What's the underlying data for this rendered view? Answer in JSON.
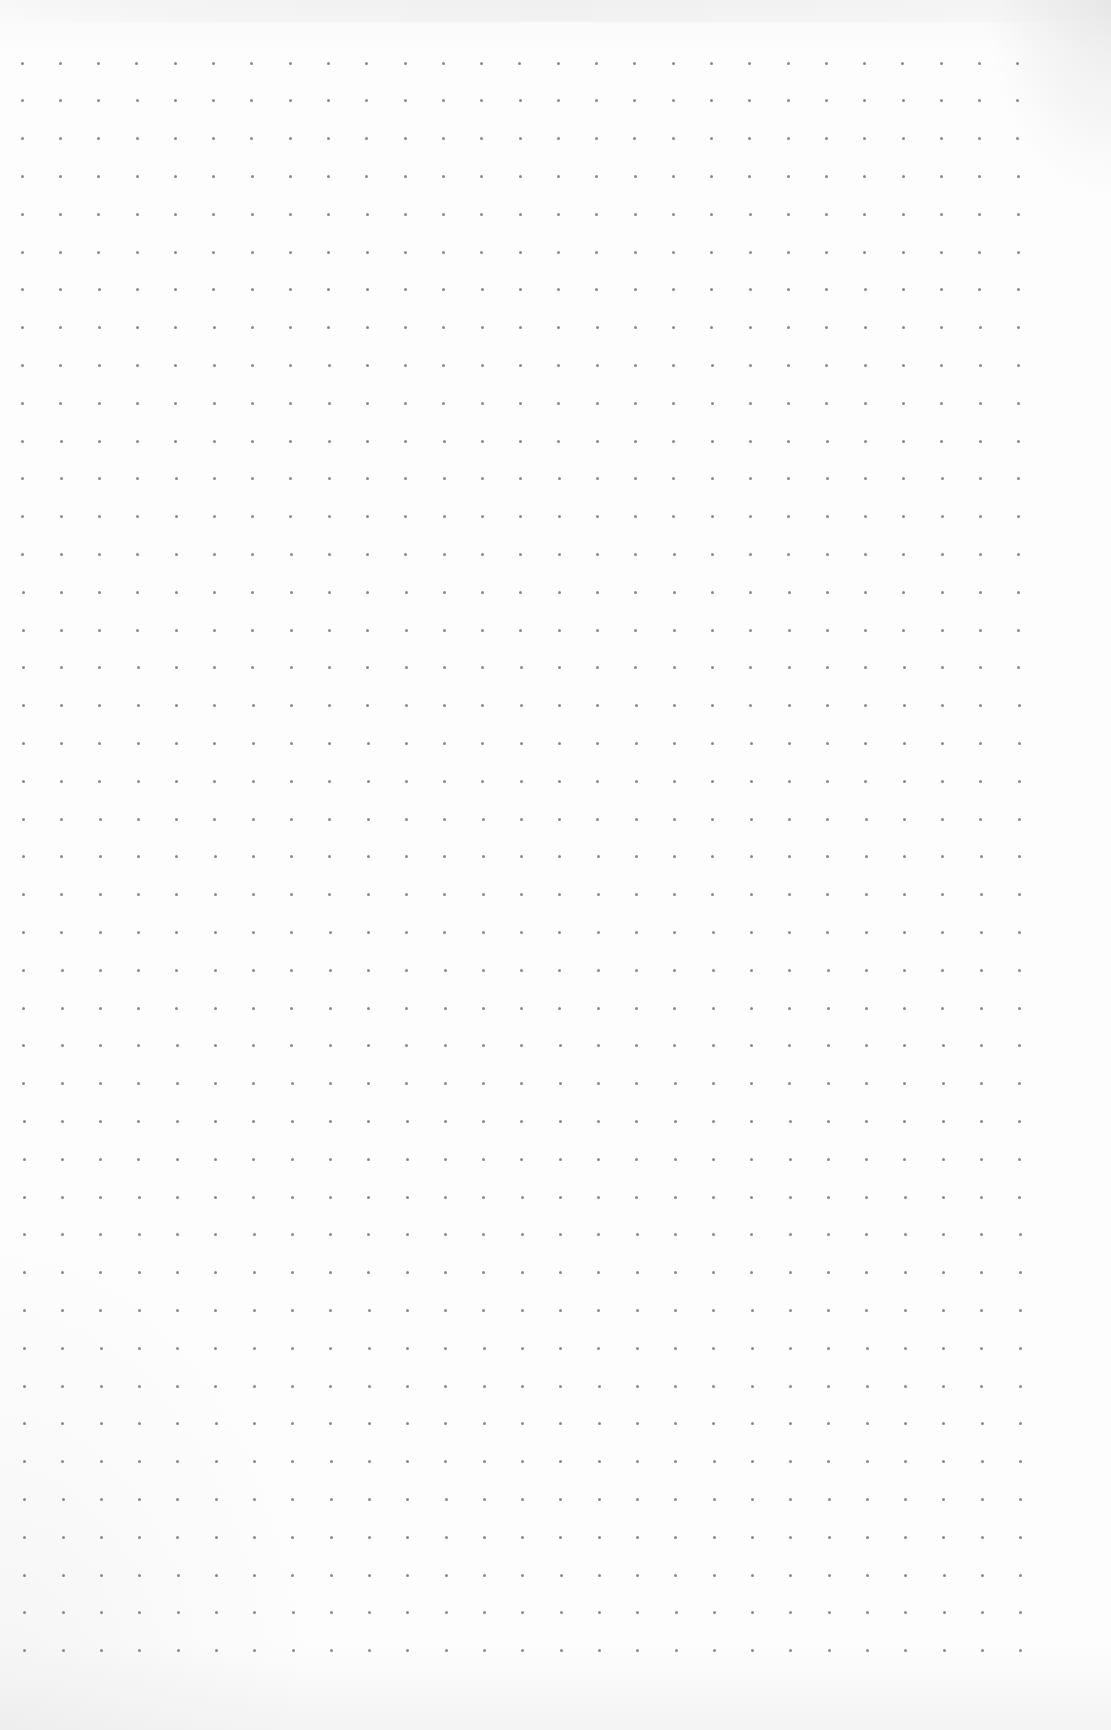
{
  "page": {
    "type": "dot-grid-paper",
    "background_color": "#fcfcfc",
    "dot_color": "#8a8a8a"
  },
  "grid": {
    "columns": 27,
    "rows": 43,
    "origin_x": 22,
    "origin_y": 63,
    "spacing_x": 38.3,
    "spacing_y": 37.8,
    "skew_x_per_row": 0.07,
    "dot_size": 3
  }
}
